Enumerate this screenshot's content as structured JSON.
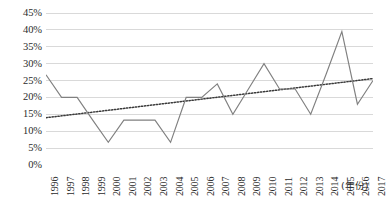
{
  "chart_data": {
    "type": "line",
    "title": "",
    "subtitle": "",
    "xlabel": "(年份)",
    "ylabel": "",
    "grid": true,
    "legend": "none",
    "xlim": [
      1996,
      2017
    ],
    "ylim": [
      0,
      45
    ],
    "y_tick_labels": [
      "45%",
      "40%",
      "35%",
      "30%",
      "25%",
      "20%",
      "15%",
      "10%",
      "5%",
      "0%"
    ],
    "y_tick_values": [
      45,
      40,
      35,
      30,
      25,
      20,
      15,
      10,
      5,
      0
    ],
    "y_unit": "%",
    "categories": [
      "1996",
      "1997",
      "1998",
      "1999",
      "2000",
      "2001",
      "2002",
      "2003",
      "2004",
      "2005",
      "2006",
      "2007",
      "2008",
      "2009",
      "2010",
      "2011",
      "2012",
      "2013",
      "2014",
      "2015",
      "2016",
      "2017"
    ],
    "series": [
      {
        "name": "比例",
        "type": "line",
        "style": "solid",
        "color": "#808080",
        "values": [
          26.7,
          20.0,
          20.0,
          13.3,
          6.7,
          13.3,
          13.3,
          13.3,
          6.7,
          20.0,
          20.0,
          24.0,
          15.0,
          22.5,
          30.0,
          22.5,
          22.5,
          15.0,
          27.0,
          39.5,
          18.0,
          25.0
        ]
      },
      {
        "name": "线性趋势线",
        "type": "trendline",
        "style": "dotted",
        "color": "#3a3a3a",
        "start_value": 14.0,
        "end_value": 25.6,
        "values": [
          14.0,
          14.55,
          15.1,
          15.65,
          16.2,
          16.75,
          17.3,
          17.85,
          18.4,
          18.95,
          19.5,
          20.06,
          20.61,
          21.16,
          21.71,
          22.26,
          22.81,
          23.36,
          23.91,
          24.46,
          25.01,
          25.6
        ]
      }
    ],
    "colors": {
      "plot_line": "#808080",
      "trend_line": "#3a3a3a",
      "gridline": "#d9d9d9",
      "axis_line": "#bfbfbf",
      "text": "#2b2b2b",
      "background": "#ffffff"
    }
  }
}
